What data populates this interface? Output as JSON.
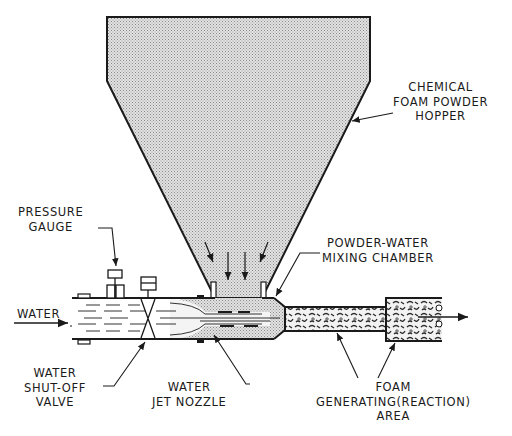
{
  "diagram": {
    "labels": {
      "hopper": [
        "CHEMICAL",
        "FOAM POWDER",
        "HOPPER"
      ],
      "pressure_gauge": [
        "PRESSURE",
        "GAUGE"
      ],
      "mixing_chamber": [
        "POWDER-WATER",
        "MIXING CHAMBER"
      ],
      "water_inlet": "WATER",
      "shutoff_valve": [
        "WATER",
        "SHUT-OFF",
        "VALVE"
      ],
      "jet_nozzle": [
        "WATER",
        "JET NOZZLE"
      ],
      "reaction_area": [
        "FOAM",
        "GENERATING(REACTION)",
        "AREA"
      ]
    },
    "colors": {
      "line": "#1a1a1a",
      "powder_fill": "#c8c8c8",
      "background": "#ffffff"
    },
    "flow": [
      "water-inlet",
      "shut-off-valve",
      "jet-nozzle",
      "mixing-chamber",
      "reaction-area",
      "foam-outlet"
    ]
  }
}
